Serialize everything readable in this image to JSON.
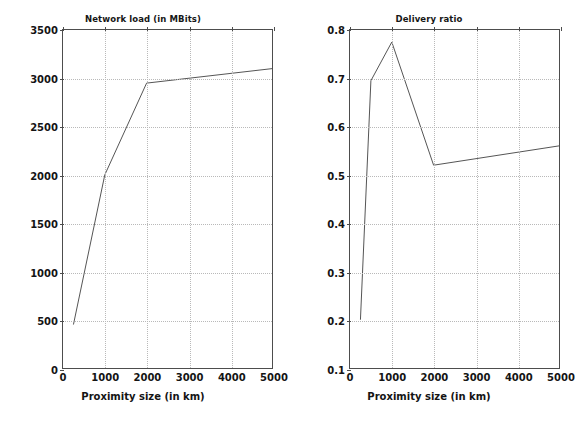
{
  "figure": {
    "background": "#ffffff",
    "line_color": "#555555",
    "grid_color": "#b9b9b9",
    "axis_color": "#4d4d4d"
  },
  "chart_data": [
    {
      "type": "line",
      "title": "Network load (in MBits)",
      "xlabel": "Proximity size (in km)",
      "ylabel": "",
      "xlim": [
        0,
        5000
      ],
      "ylim": [
        0,
        3500
      ],
      "xticks": [
        0,
        1000,
        2000,
        3000,
        4000,
        5000
      ],
      "xticklabels": [
        "0",
        "1000",
        "2000",
        "3000",
        "4000",
        "5000"
      ],
      "yticks": [
        0,
        500,
        1000,
        1500,
        2000,
        2500,
        3000,
        3500
      ],
      "yticklabels": [
        "0",
        "500",
        "1000",
        "1500",
        "2000",
        "2500",
        "3000",
        "3500"
      ],
      "grid": true,
      "legend": "none",
      "series": [
        {
          "name": "network load",
          "x": [
            250,
            1000,
            2000,
            5000
          ],
          "values": [
            450,
            2000,
            2950,
            3100
          ]
        }
      ]
    },
    {
      "type": "line",
      "title": "Delivery ratio",
      "xlabel": "Proximity size (in km)",
      "ylabel": "",
      "xlim": [
        0,
        5000
      ],
      "ylim": [
        0.1,
        0.8
      ],
      "xticks": [
        0,
        1000,
        2000,
        3000,
        4000,
        5000
      ],
      "xticklabels": [
        "0",
        "1000",
        "2000",
        "3000",
        "4000",
        "5000"
      ],
      "yticks": [
        0.1,
        0.2,
        0.3,
        0.4,
        0.5,
        0.6,
        0.7,
        0.8
      ],
      "yticklabels": [
        "0.1",
        "0.2",
        "0.3",
        "0.4",
        "0.5",
        "0.6",
        "0.7",
        "0.8"
      ],
      "grid": true,
      "legend": "none",
      "series": [
        {
          "name": "delivery ratio",
          "x": [
            250,
            500,
            1000,
            2000,
            5000
          ],
          "values": [
            0.2,
            0.695,
            0.775,
            0.52,
            0.56
          ]
        }
      ]
    }
  ]
}
